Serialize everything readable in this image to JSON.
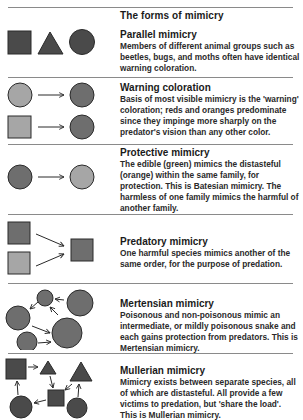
{
  "title": "The forms of mimicry",
  "colors": {
    "dark": "#4a4a4a",
    "medium": "#6e6e6e",
    "light": "#a6a6a6",
    "rule": "#8a8a8a"
  },
  "sections": [
    {
      "heading": "Parallel mimicry",
      "body": "Members of different animal groups such as beetles, bugs, and moths often have identical warning coloration.",
      "icons": [
        "square-icon",
        "triangle-icon",
        "circle-icon"
      ]
    },
    {
      "heading": "Warning coloration",
      "body": "Basis of most visible mimicry is the 'warning' coloration; reds and oranges predominate since they impinge more sharply on the predator's vision than any other color.",
      "icons": [
        "circle-icon",
        "arrow-right-icon",
        "circle-icon",
        "square-icon",
        "arrow-right-icon",
        "circle-icon"
      ]
    },
    {
      "heading": "Protective mimicry",
      "body": "The edible (green) mimics the distasteful (orange) within the same family, for protection. This is Batesian mimicry. The harmless of one family mimics the harmful of another family.",
      "icons": [
        "circle-icon",
        "arrow-right-icon",
        "circle-icon"
      ]
    },
    {
      "heading": "Predatory mimicry",
      "body": "One harmful species mimics another of the same order, for the purpose of predation.",
      "icons": [
        "square-icon",
        "square-icon",
        "arrow-icon",
        "arrow-icon",
        "square-icon"
      ]
    },
    {
      "heading": "Mertensian mimicry",
      "body": "Poisonous and non-poisonous mimic an intermediate, or mildly poisonous snake and each gains protection from predators. This is Mertensian mimicry.",
      "icons": [
        "circle-icon",
        "circle-icon",
        "circle-icon",
        "circle-icon",
        "circle-icon"
      ]
    },
    {
      "heading": "Mullerian mimicry",
      "body": "Mimicry exists between separate species, all of which are distasteful. All provide a few victims to predation, but 'share the load'. This is Mullerian mimicry.",
      "icons": [
        "square-icon",
        "triangle-icon",
        "triangle-icon",
        "square-icon",
        "circle-icon",
        "circle-icon"
      ]
    }
  ]
}
